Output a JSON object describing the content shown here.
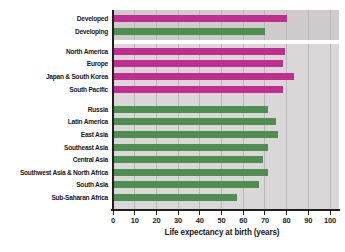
{
  "chart_data": {
    "type": "bar",
    "orientation": "horizontal",
    "title": "",
    "xlabel": "Life expectancy at birth (years)",
    "ylabel": "",
    "xlim": [
      0,
      100
    ],
    "xticks": [
      0,
      10,
      20,
      30,
      40,
      50,
      60,
      70,
      80,
      90,
      100
    ],
    "grid": true,
    "legend": "none",
    "groups": [
      {
        "name": "development-summary",
        "rows": [
          {
            "label": "Developed",
            "value": 80,
            "color": "magenta"
          },
          {
            "label": "Developing",
            "value": 70,
            "color": "green"
          }
        ]
      },
      {
        "name": "developed-regions",
        "rows": [
          {
            "label": "North America",
            "value": 79,
            "color": "magenta"
          },
          {
            "label": "Europe",
            "value": 78,
            "color": "magenta"
          },
          {
            "label": "Japan & South Korea",
            "value": 83,
            "color": "magenta"
          },
          {
            "label": "South Pacific",
            "value": 78,
            "color": "magenta"
          }
        ]
      },
      {
        "name": "developing-regions",
        "rows": [
          {
            "label": "Russia",
            "value": 71,
            "color": "green"
          },
          {
            "label": "Latin America",
            "value": 75,
            "color": "green"
          },
          {
            "label": "East Asia",
            "value": 76,
            "color": "green"
          },
          {
            "label": "Southeast Asia",
            "value": 71,
            "color": "green"
          },
          {
            "label": "Central Asia",
            "value": 69,
            "color": "green"
          },
          {
            "label": "Southwest Asia & North Africa",
            "value": 71,
            "color": "green"
          },
          {
            "label": "South Asia",
            "value": 67,
            "color": "green"
          },
          {
            "label": "Sub-Saharan Africa",
            "value": 57,
            "color": "green"
          }
        ]
      }
    ]
  },
  "colors": {
    "magenta": "#c12e90",
    "green": "#4f8e51",
    "plot_bg": "#d9d7d8",
    "plot_bg_summary": "#cdcbcc",
    "gridline": "#bab8b9",
    "axis": "#221e1f",
    "separator": "#ffffff"
  }
}
